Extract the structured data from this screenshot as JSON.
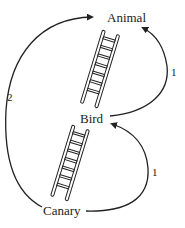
{
  "diagram": {
    "nodes": [
      {
        "id": "animal",
        "label": "Animal"
      },
      {
        "id": "bird",
        "label": "Bird"
      },
      {
        "id": "canary",
        "label": "Canary"
      }
    ],
    "edges": [
      {
        "from": "bird",
        "to": "animal",
        "label": "1"
      },
      {
        "from": "canary",
        "to": "animal",
        "label": "2"
      },
      {
        "from": "canary",
        "to": "bird",
        "label": "1"
      }
    ],
    "ladders": [
      {
        "between": [
          "bird",
          "animal"
        ],
        "icon": "ladder-icon"
      },
      {
        "between": [
          "canary",
          "bird"
        ],
        "icon": "ladder-icon"
      }
    ],
    "colors": {
      "stroke": "#222222",
      "background": "#ffffff"
    }
  }
}
